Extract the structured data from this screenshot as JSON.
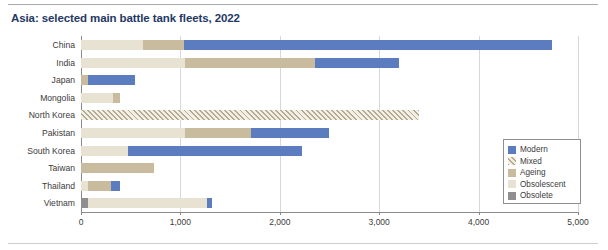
{
  "title": "Asia: selected main battle tank fleets, 2022",
  "chart_data": {
    "type": "bar",
    "orientation": "horizontal",
    "stacked": true,
    "title": "Asia: selected main battle tank fleets, 2022",
    "xlabel": "",
    "ylabel": "",
    "xlim": [
      0,
      5000
    ],
    "xticks": [
      0,
      1000,
      2000,
      3000,
      4000,
      5000
    ],
    "xtick_labels": [
      "0",
      "1,000",
      "2,000",
      "3,000",
      "4,000",
      "5,000"
    ],
    "grid": true,
    "legend_position": "right-inside",
    "categories": [
      "China",
      "India",
      "Japan",
      "Mongolia",
      "North Korea",
      "Pakistan",
      "South Korea",
      "Taiwan",
      "Thailand",
      "Vietnam"
    ],
    "series": [
      {
        "name": "Modern",
        "color": "#5b7dc0",
        "values": [
          3700,
          850,
          470,
          0,
          0,
          780,
          1750,
          0,
          90,
          50
        ]
      },
      {
        "name": "Mixed",
        "color": "#b3aa93",
        "values": [
          0,
          0,
          0,
          0,
          3400,
          0,
          0,
          0,
          0,
          0
        ]
      },
      {
        "name": "Ageing",
        "color": "#c9bb9d",
        "values": [
          420,
          1300,
          70,
          70,
          0,
          660,
          0,
          730,
          230,
          0
        ]
      },
      {
        "name": "Obsolescent",
        "color": "#e8e2d2",
        "values": [
          620,
          1050,
          0,
          320,
          0,
          1050,
          470,
          0,
          70,
          1200
        ]
      },
      {
        "name": "Obsolete",
        "color": "#8f8f8f",
        "values": [
          0,
          0,
          0,
          0,
          0,
          0,
          0,
          0,
          0,
          70
        ]
      }
    ],
    "totals": [
      4740,
      3200,
      540,
      390,
      3400,
      2490,
      2220,
      730,
      390,
      1320
    ],
    "stack_order": [
      "Obsolete",
      "Obsolescent",
      "Ageing",
      "Mixed",
      "Modern"
    ],
    "bars": [
      {
        "category": "China",
        "segments": [
          {
            "series": "Obsolescent",
            "value": 620
          },
          {
            "series": "Ageing",
            "value": 420
          },
          {
            "series": "Modern",
            "value": 3700
          }
        ]
      },
      {
        "category": "India",
        "segments": [
          {
            "series": "Obsolescent",
            "value": 1050
          },
          {
            "series": "Ageing",
            "value": 1300
          },
          {
            "series": "Modern",
            "value": 850
          }
        ]
      },
      {
        "category": "Japan",
        "segments": [
          {
            "series": "Ageing",
            "value": 70
          },
          {
            "series": "Modern",
            "value": 470
          }
        ]
      },
      {
        "category": "Mongolia",
        "segments": [
          {
            "series": "Obsolescent",
            "value": 320
          },
          {
            "series": "Ageing",
            "value": 70
          }
        ]
      },
      {
        "category": "North Korea",
        "segments": [
          {
            "series": "Mixed",
            "value": 3400
          }
        ]
      },
      {
        "category": "Pakistan",
        "segments": [
          {
            "series": "Obsolescent",
            "value": 1050
          },
          {
            "series": "Ageing",
            "value": 660
          },
          {
            "series": "Modern",
            "value": 780
          }
        ]
      },
      {
        "category": "South Korea",
        "segments": [
          {
            "series": "Obsolescent",
            "value": 470
          },
          {
            "series": "Modern",
            "value": 1750
          }
        ]
      },
      {
        "category": "Taiwan",
        "segments": [
          {
            "series": "Ageing",
            "value": 730
          }
        ]
      },
      {
        "category": "Thailand",
        "segments": [
          {
            "series": "Obsolescent",
            "value": 70
          },
          {
            "series": "Ageing",
            "value": 230
          },
          {
            "series": "Modern",
            "value": 90
          }
        ]
      },
      {
        "category": "Vietnam",
        "segments": [
          {
            "series": "Obsolete",
            "value": 70
          },
          {
            "series": "Obsolescent",
            "value": 1200
          },
          {
            "series": "Modern",
            "value": 50
          }
        ]
      }
    ]
  },
  "legend": {
    "items": [
      {
        "label": "Modern",
        "swatch": "modern"
      },
      {
        "label": "Mixed",
        "swatch": "mixed"
      },
      {
        "label": "Ageing",
        "swatch": "ageing"
      },
      {
        "label": "Obsolescent",
        "swatch": "obsolescent"
      },
      {
        "label": "Obsolete",
        "swatch": "obsolete"
      }
    ]
  },
  "colors": {
    "title": "#1f3864",
    "modern": "#5b7dc0",
    "mixed": "#b3aa93",
    "ageing": "#c9bb9d",
    "obsolescent": "#e8e2d2",
    "obsolete": "#8f8f8f"
  }
}
